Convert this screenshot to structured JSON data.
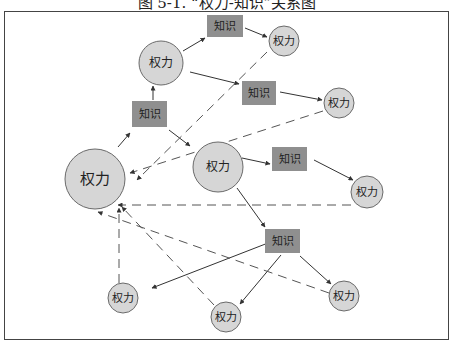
{
  "figure": {
    "title": "图 5-1. “权力-知识”关系图"
  },
  "colors": {
    "power_fill": "#d6d6d6",
    "power_stroke": "#6a6a6a",
    "knowledge_fill": "#8f8f8f",
    "edge": "#333333",
    "dashed_edge": "#555555"
  },
  "nodes": [
    {
      "id": "P0",
      "type": "power",
      "label": "权力",
      "cx": 95,
      "cy": 179,
      "r": 30,
      "font": 15
    },
    {
      "id": "P1",
      "type": "power",
      "label": "权力",
      "cx": 161,
      "cy": 63,
      "r": 22,
      "font": 12
    },
    {
      "id": "P2",
      "type": "power",
      "label": "权力",
      "cx": 284,
      "cy": 41,
      "r": 15,
      "font": 11
    },
    {
      "id": "P3",
      "type": "power",
      "label": "权力",
      "cx": 339,
      "cy": 103,
      "r": 15,
      "font": 11
    },
    {
      "id": "P4",
      "type": "power",
      "label": "权力",
      "cx": 218,
      "cy": 167,
      "r": 25,
      "font": 12
    },
    {
      "id": "P5",
      "type": "power",
      "label": "权力",
      "cx": 367,
      "cy": 192,
      "r": 16,
      "font": 11
    },
    {
      "id": "P6",
      "type": "power",
      "label": "权力",
      "cx": 123,
      "cy": 298,
      "r": 15,
      "font": 11
    },
    {
      "id": "P7",
      "type": "power",
      "label": "权力",
      "cx": 226,
      "cy": 317,
      "r": 15,
      "font": 11
    },
    {
      "id": "P8",
      "type": "power",
      "label": "权力",
      "cx": 344,
      "cy": 296,
      "r": 15,
      "font": 11
    },
    {
      "id": "K1",
      "type": "knowledge",
      "label": "知识",
      "x": 207,
      "y": 15,
      "w": 36,
      "h": 22
    },
    {
      "id": "K2",
      "type": "knowledge",
      "label": "知识",
      "x": 132,
      "y": 101,
      "w": 35,
      "h": 26
    },
    {
      "id": "K3",
      "type": "knowledge",
      "label": "知识",
      "x": 242,
      "y": 81,
      "w": 34,
      "h": 24
    },
    {
      "id": "K4",
      "type": "knowledge",
      "label": "知识",
      "x": 272,
      "y": 147,
      "w": 35,
      "h": 24
    },
    {
      "id": "K5",
      "type": "knowledge",
      "label": "知识",
      "x": 265,
      "y": 229,
      "w": 35,
      "h": 24
    }
  ],
  "edges": [
    {
      "from": "P0",
      "to": "K2",
      "style": "solid",
      "x1": 118,
      "y1": 147,
      "x2": 130,
      "y2": 133
    },
    {
      "from": "K2",
      "to": "P1",
      "style": "solid",
      "x1": 153,
      "y1": 100,
      "x2": 153,
      "y2": 86
    },
    {
      "from": "P1",
      "to": "K1",
      "style": "solid",
      "x1": 183,
      "y1": 51,
      "x2": 205,
      "y2": 38
    },
    {
      "from": "K1",
      "to": "P2",
      "style": "solid",
      "x1": 245,
      "y1": 28,
      "x2": 267,
      "y2": 37
    },
    {
      "from": "P1",
      "to": "K3",
      "style": "solid",
      "x1": 190,
      "y1": 72,
      "x2": 239,
      "y2": 84
    },
    {
      "from": "K3",
      "to": "P3",
      "style": "solid",
      "x1": 280,
      "y1": 92,
      "x2": 322,
      "y2": 100
    },
    {
      "from": "K2",
      "to": "P4",
      "style": "solid",
      "x1": 169,
      "y1": 130,
      "x2": 190,
      "y2": 146
    },
    {
      "from": "P4",
      "to": "K4",
      "style": "solid",
      "x1": 242,
      "y1": 158,
      "x2": 270,
      "y2": 164
    },
    {
      "from": "K4",
      "to": "P5",
      "style": "solid",
      "x1": 314,
      "y1": 160,
      "x2": 353,
      "y2": 180
    },
    {
      "from": "P4",
      "to": "K5",
      "style": "solid",
      "x1": 237,
      "y1": 188,
      "x2": 265,
      "y2": 227
    },
    {
      "from": "K5",
      "to": "P6",
      "style": "solid",
      "x1": 268,
      "y1": 243,
      "x2": 152,
      "y2": 288
    },
    {
      "from": "K5",
      "to": "P7",
      "style": "solid",
      "x1": 281,
      "y1": 255,
      "x2": 240,
      "y2": 304
    },
    {
      "from": "K5",
      "to": "P8",
      "style": "solid",
      "x1": 300,
      "y1": 256,
      "x2": 331,
      "y2": 284
    },
    {
      "from": "P2",
      "to": "P0",
      "style": "dashed",
      "x1": 267,
      "y1": 52,
      "x2": 137,
      "y2": 180
    },
    {
      "from": "P3",
      "to": "P0",
      "style": "dashed",
      "x1": 323,
      "y1": 111,
      "x2": 130,
      "y2": 173
    },
    {
      "from": "P5",
      "to": "P0",
      "style": "dashed",
      "x1": 351,
      "y1": 205,
      "x2": 118,
      "y2": 205
    },
    {
      "from": "P8",
      "to": "P0",
      "style": "dashed",
      "x1": 329,
      "y1": 293,
      "x2": 98,
      "y2": 212
    },
    {
      "from": "P6",
      "to": "P0",
      "style": "dashed",
      "x1": 119,
      "y1": 283,
      "x2": 119,
      "y2": 208
    },
    {
      "from": "P7",
      "to": "P0",
      "style": "dashed",
      "x1": 214,
      "y1": 305,
      "x2": 122,
      "y2": 207
    }
  ]
}
